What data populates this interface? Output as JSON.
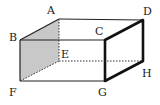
{
  "diagram": {
    "type": "rectangular-prism",
    "vertices": {
      "A": {
        "label": "A",
        "x": 59,
        "y": 19,
        "lx": 47,
        "ly": 14
      },
      "B": {
        "label": "B",
        "x": 20,
        "y": 40,
        "lx": 9,
        "ly": 41
      },
      "C": {
        "label": "C",
        "x": 105,
        "y": 40,
        "lx": 95,
        "ly": 35
      },
      "D": {
        "label": "D",
        "x": 143,
        "y": 20,
        "lx": 143,
        "ly": 15
      },
      "E": {
        "label": "E",
        "x": 59,
        "y": 61,
        "lx": 61,
        "ly": 58
      },
      "F": {
        "label": "F",
        "x": 20,
        "y": 81,
        "lx": 9,
        "ly": 96
      },
      "G": {
        "label": "G",
        "x": 105,
        "y": 81,
        "lx": 98,
        "ly": 96
      },
      "H": {
        "label": "H",
        "x": 143,
        "y": 61,
        "lx": 142,
        "ly": 77
      }
    },
    "shaded_face": [
      "A",
      "B",
      "F",
      "E"
    ],
    "bold_face": [
      "C",
      "D",
      "H",
      "G"
    ],
    "hidden_edges": [
      [
        "A",
        "E"
      ],
      [
        "E",
        "F"
      ],
      [
        "E",
        "H"
      ]
    ],
    "colors": {
      "line": "#222222",
      "shade": "#c8c8c8"
    }
  }
}
